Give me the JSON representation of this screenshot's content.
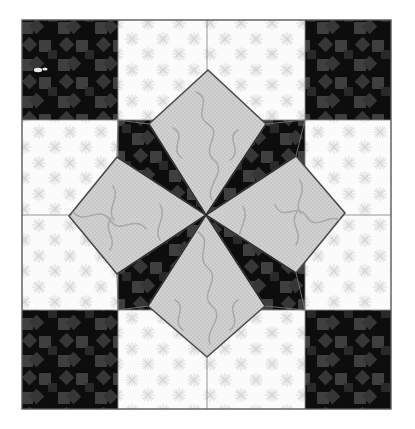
{
  "artwork": {
    "title": "Eight-Pointed Star Quilt Block",
    "kind": "quilt-block-photograph",
    "caption": "",
    "canvas": {
      "width": 415,
      "height": 429,
      "background": "#ffffff"
    },
    "block": {
      "left": 22,
      "top": 20,
      "right": 391,
      "bottom": 409,
      "border_color": "#5a5a5a",
      "border_width": 1.2
    },
    "grid": {
      "columns_x": [
        22,
        118,
        207,
        305,
        391
      ],
      "rows_y": [
        20,
        120,
        215,
        310,
        409
      ],
      "line_color": "#7a7a7a",
      "line_width": 0.9
    },
    "palette": {
      "dark": "#0d0d0d",
      "dark_motif": "#3a3a3a",
      "light": "#fbfbfb",
      "light_motif": "#d7d7d7",
      "gray": "#cfcfcf",
      "gray_motif": "#9a9a9a",
      "outline": "#4a4a4a",
      "paper": "#ffffff"
    },
    "patches": [
      {
        "name": "corner-top-left",
        "fabric": "dark",
        "motif": "diamond-square"
      },
      {
        "name": "edge-top-left",
        "fabric": "light",
        "motif": "starburst"
      },
      {
        "name": "edge-top-right",
        "fabric": "light",
        "motif": "starburst"
      },
      {
        "name": "corner-top-right",
        "fabric": "dark",
        "motif": "diamond-square"
      },
      {
        "name": "edge-left-upper",
        "fabric": "light",
        "motif": "starburst"
      },
      {
        "name": "center-upper-left",
        "fabric": "dark",
        "motif": "diamond-square"
      },
      {
        "name": "center-upper-right",
        "fabric": "dark",
        "motif": "diamond-square"
      },
      {
        "name": "edge-right-upper",
        "fabric": "light",
        "motif": "starburst"
      },
      {
        "name": "edge-left-lower",
        "fabric": "light",
        "motif": "starburst"
      },
      {
        "name": "center-lower-left",
        "fabric": "dark",
        "motif": "diamond-square"
      },
      {
        "name": "center-lower-right",
        "fabric": "dark",
        "motif": "diamond-square"
      },
      {
        "name": "edge-right-lower",
        "fabric": "light",
        "motif": "starburst"
      },
      {
        "name": "corner-bottom-left",
        "fabric": "dark",
        "motif": "diamond-square"
      },
      {
        "name": "edge-bottom-left",
        "fabric": "light",
        "motif": "starburst"
      },
      {
        "name": "edge-bottom-right",
        "fabric": "light",
        "motif": "starburst"
      },
      {
        "name": "corner-bottom-right",
        "fabric": "dark",
        "motif": "diamond-square"
      }
    ],
    "star": {
      "center_x": 206,
      "center_y": 215,
      "points": [
        {
          "name": "star-point-north",
          "fabric": "gray",
          "tip_x": 208,
          "tip_y": 70
        },
        {
          "name": "star-point-east",
          "fabric": "gray",
          "tip_x": 345,
          "tip_y": 213
        },
        {
          "name": "star-point-south",
          "fabric": "gray",
          "tip_x": 207,
          "tip_y": 357
        },
        {
          "name": "star-point-west",
          "fabric": "gray",
          "tip_x": 69,
          "tip_y": 216
        }
      ],
      "quilting_motif": "s-curve-squiggle",
      "point_count": 4,
      "spike_count": 4
    },
    "motifs": {
      "starburst_spokes": 12,
      "starburst_radius": 13,
      "starburst_spacing": 31,
      "diamond_size": 13,
      "diamond_spacing": 36
    },
    "blemish": {
      "name": "light-speck",
      "x": 38,
      "y": 70
    }
  }
}
